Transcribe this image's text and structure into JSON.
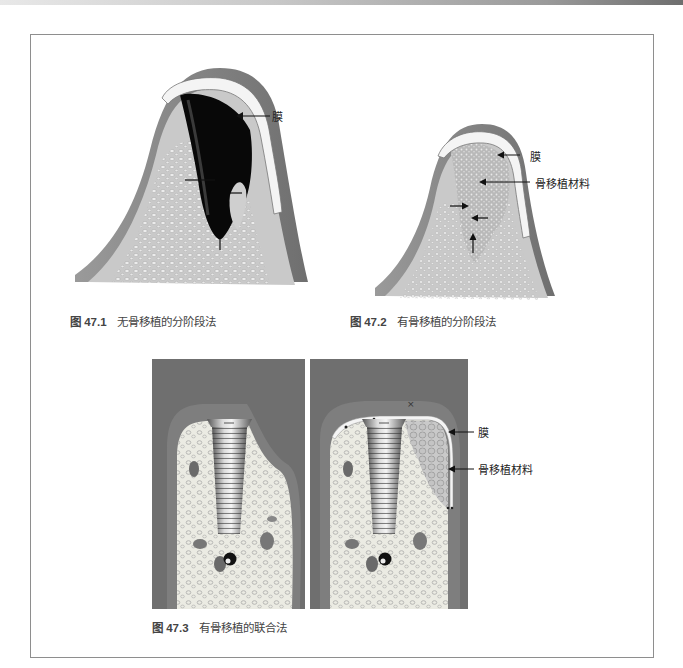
{
  "figures": [
    {
      "id": "47.1",
      "caption_number": "图 47.1",
      "caption_text": "无骨移植的分阶段法",
      "labels": {
        "membrane": "膜"
      }
    },
    {
      "id": "47.2",
      "caption_number": "图 47.2",
      "caption_text": "有骨移植的分阶段法",
      "labels": {
        "membrane": "膜",
        "graft": "骨移植材料"
      }
    },
    {
      "id": "47.3",
      "caption_number": "图 47.3",
      "caption_text": "有骨移植的联合法",
      "labels": {
        "membrane": "膜",
        "graft": "骨移植材料"
      }
    }
  ],
  "colors": {
    "soft_tissue": "#8a8a8a",
    "bone": "#c9c9c9",
    "membrane": "#f2f2f2",
    "defect": "#0a0a0a",
    "panel_bg": "#6f6f6f",
    "frame": "#8e8e8e"
  }
}
